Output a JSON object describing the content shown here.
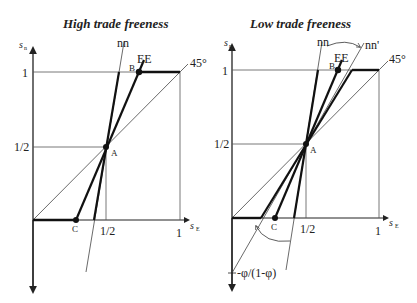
{
  "panels": [
    {
      "title": "High trade freeness",
      "y_axis_label": "s",
      "y_axis_sub": "n",
      "x_axis_label": "s",
      "x_axis_sub": "E",
      "y_ticks": [
        "1",
        "1/2"
      ],
      "x_ticks": [
        "1/2",
        "1"
      ],
      "curve_labels": {
        "nn": "nn",
        "EE": "EE",
        "diag": "45°"
      },
      "points": {
        "A": "A",
        "B": "B",
        "C": "C"
      }
    },
    {
      "title": "Low trade freeness",
      "y_axis_label": "s",
      "y_axis_sub": "n",
      "x_axis_label": "s",
      "x_axis_sub": "E",
      "y_ticks": [
        "1",
        "1/2"
      ],
      "x_ticks": [
        "1/2",
        "1"
      ],
      "curve_labels": {
        "nn": "nn",
        "nn_prime": "nn'",
        "EE": "EE",
        "diag": "45°"
      },
      "points": {
        "A": "A",
        "B": "B",
        "C": "C"
      },
      "intercept_label": "-φ/(1-φ)"
    }
  ],
  "colors": {
    "ink": "#222222",
    "thin": "#444444",
    "background": "#ffffff"
  }
}
